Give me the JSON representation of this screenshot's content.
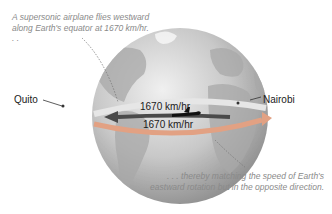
{
  "captions": {
    "top": "A supersonic airplane flies westward along Earth's equator at 1670 km/hr. . .",
    "bottom": ". . . thereby matching the speed of Earth's eastward rotation but in the opposite direction."
  },
  "labels": {
    "city_west": "Quito",
    "city_east": "Nairobi",
    "plane_speed": "1670 km/hr",
    "earth_speed": "1670 km/hr"
  },
  "icons": {
    "globe": "earth-globe",
    "plane": "airplane-silhouette",
    "westward_arrow": "arrow-left",
    "eastward_arrow": "arrow-right"
  },
  "colors": {
    "plane_arrow": "#4a4a4a",
    "rotation_band": "#e2a183",
    "equator_band": "#d8d8d8",
    "ocean": "#c9c9c9",
    "land": "#a9a9a9",
    "caption_text": "#8a8a8a"
  }
}
